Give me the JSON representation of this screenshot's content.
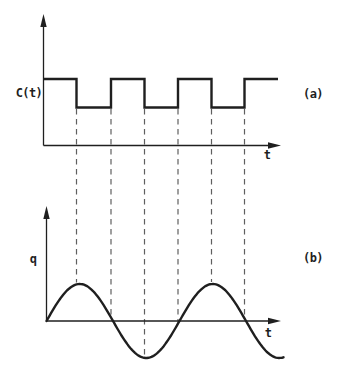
{
  "figure": {
    "colors": {
      "background": "#ffffff",
      "ink": "#1f1f1f",
      "dash": "#5f5f5f"
    },
    "panel_a": {
      "tag": "(a)",
      "y_axis_label": "C(t)",
      "x_axis_label": "t",
      "waveform": {
        "type": "square",
        "starts_at": "high",
        "high_y": 79,
        "low_y": 107.5,
        "x_start": 43.5,
        "x_end": 278,
        "transition_xs": [
          76.5,
          111,
          144.5,
          178,
          211.5,
          244.5
        ]
      },
      "axis": {
        "origin_x": 43.5,
        "origin_y": 145.5,
        "y_arrow_tip_y": 14,
        "x_arrow_tip_x": 281
      }
    },
    "panel_b": {
      "tag": "(b)",
      "y_axis_label": "q",
      "x_axis_label": "t",
      "waveform": {
        "type": "sine",
        "baseline_y": 321,
        "amplitude": 37,
        "period": 133,
        "x_start": 46.5,
        "x_end": 284
      },
      "axis": {
        "origin_x": 46.5,
        "origin_y": 321,
        "y_arrow_tip_y": 206,
        "x_arrow_tip_x": 281
      }
    },
    "dashed_lines": {
      "top_y": 109,
      "xs": [
        76.5,
        111,
        144.5,
        178,
        211.5,
        244.5
      ]
    }
  }
}
